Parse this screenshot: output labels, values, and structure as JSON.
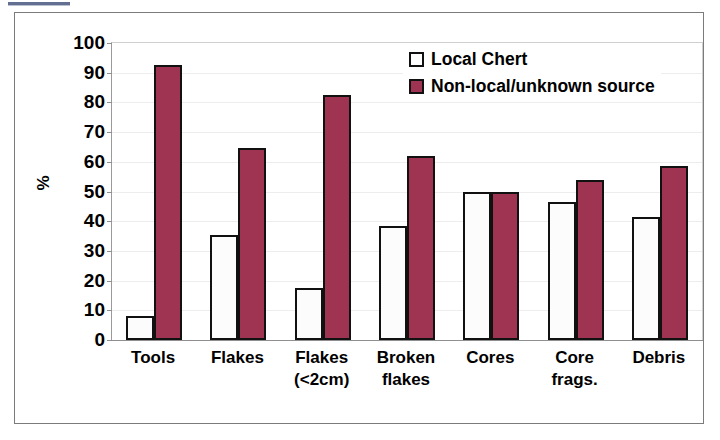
{
  "chart_data": {
    "type": "bar",
    "title": "",
    "xlabel": "",
    "ylabel": "%",
    "ylim": [
      0,
      100
    ],
    "ytick_step": 10,
    "yticks": [
      100,
      90,
      80,
      70,
      60,
      50,
      40,
      30,
      20,
      10,
      0
    ],
    "grid": true,
    "legend_position": "top-right",
    "categories": [
      "Tools",
      "Flakes",
      "Flakes (<2cm)",
      "Broken flakes",
      "Cores",
      "Core frags.",
      "Debris"
    ],
    "category_lines": [
      [
        "Tools",
        ""
      ],
      [
        "Flakes",
        ""
      ],
      [
        "Flakes",
        "(<2cm)"
      ],
      [
        "Broken",
        "flakes"
      ],
      [
        "Cores",
        ""
      ],
      [
        "Core",
        "frags."
      ],
      [
        "Debris",
        ""
      ]
    ],
    "series": [
      {
        "name": "Local Chert",
        "color": "#ffffff",
        "values": [
          8,
          35.5,
          17.5,
          38.5,
          50,
          46.5,
          41.5
        ]
      },
      {
        "name": "Non-local/unknown source",
        "color": "#9e3352",
        "values": [
          92.5,
          64.5,
          82.5,
          62,
          50,
          54,
          58.5
        ]
      }
    ]
  },
  "legend": {
    "items": [
      {
        "label": "Local Chert",
        "swatch": "local"
      },
      {
        "label": "Non-local/unknown source",
        "swatch": "nonlocal"
      }
    ]
  },
  "axis": {
    "y_title": "%"
  },
  "colors": {
    "bar_nonlocal": "#9e3352",
    "bar_local": "#ffffff",
    "bar_outline": "#111111",
    "frame": "#7b7b7b",
    "gridline": "#ededed"
  }
}
